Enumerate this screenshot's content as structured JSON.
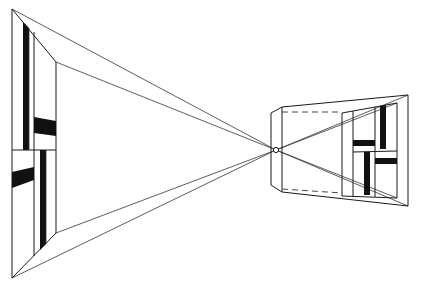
{
  "figure": {
    "title": "",
    "colors": {
      "background": "#ffffff",
      "line": "#1a1a1a",
      "fill": "#111111"
    },
    "vanishing_point": {
      "x": 276,
      "y": 150,
      "label": ""
    },
    "left_box": {
      "outer": [
        [
          12,
          9
        ],
        [
          12,
          278
        ]
      ],
      "inner": [
        [
          56,
          62
        ],
        [
          56,
          233
        ]
      ],
      "divider_y": 150
    },
    "right_box": {
      "outer_right_x": 408,
      "outer_top_y": 95,
      "outer_bottom_y": 206,
      "front_left_x": 272
    }
  }
}
